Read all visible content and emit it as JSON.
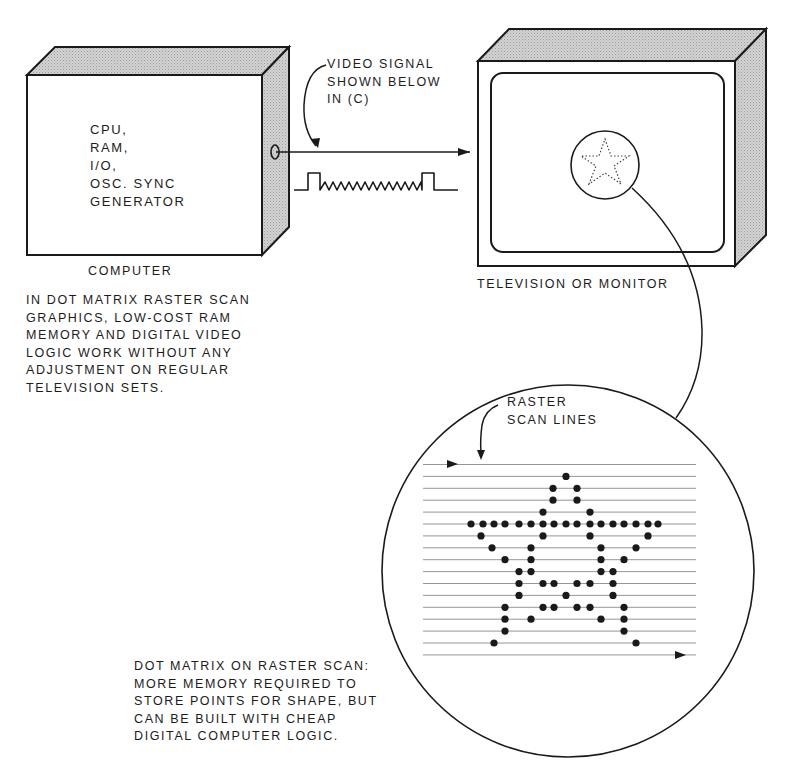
{
  "computer": {
    "box_lines": [
      "CPU,",
      "RAM,",
      "I/O,",
      "OSC. SYNC",
      "GENERATOR"
    ],
    "label": "COMPUTER",
    "caption_lines": [
      "IN DOT MATRIX RASTER SCAN",
      "GRAPHICS, LOW-COST RAM",
      "MEMORY AND DIGITAL VIDEO",
      "LOGIC WORK WITHOUT ANY",
      "ADJUSTMENT ON REGULAR",
      "TELEVISION SETS."
    ]
  },
  "signal": {
    "callout_lines": [
      "VIDEO SIGNAL",
      "SHOWN BELOW",
      "IN (C)"
    ]
  },
  "monitor": {
    "label": "TELEVISION OR MONITOR"
  },
  "raster": {
    "callout_lines": [
      "RASTER",
      "SCAN LINES"
    ],
    "scan_line_count": 17,
    "caption_lines": [
      "DOT MATRIX ON RASTER SCAN:",
      "MORE MEMORY REQUIRED TO",
      "STORE POINTS FOR SHAPE, BUT",
      "CAN BE BUILT WITH CHEAP",
      "DIGITAL COMPUTER LOGIC."
    ],
    "star_rows": [
      [
        566
      ],
      [
        553,
        577
      ],
      [
        553,
        577
      ],
      [
        543,
        590
      ],
      [
        471,
        483,
        494,
        505,
        519,
        531,
        543,
        554,
        566,
        577,
        590,
        601,
        613,
        624,
        636,
        648,
        658
      ],
      [
        481,
        543,
        590,
        648
      ],
      [
        492,
        531,
        601,
        636
      ],
      [
        505,
        531,
        601,
        624
      ],
      [
        519,
        531,
        601,
        613
      ],
      [
        519,
        543,
        554,
        577,
        590,
        613
      ],
      [
        519,
        566,
        613
      ],
      [
        505,
        543,
        554,
        577,
        590,
        624
      ],
      [
        505,
        531,
        601,
        624
      ],
      [
        505,
        624
      ],
      [
        494,
        636
      ]
    ]
  },
  "colors": {
    "ink": "#1a1a1a",
    "shade": "#c8c8c8",
    "scan_line": "#8a8a8a",
    "paper": "#ffffff"
  }
}
